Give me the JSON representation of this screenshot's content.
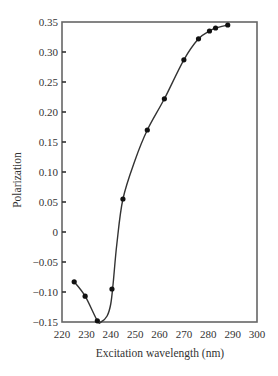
{
  "chart_data": {
    "type": "line",
    "title": "",
    "xlabel": "Excitation wavelength (nm)",
    "ylabel": "Polarization",
    "xlim": [
      220,
      300
    ],
    "ylim": [
      -0.15,
      0.35
    ],
    "xticks": [
      220,
      230,
      240,
      250,
      260,
      270,
      280,
      290,
      300
    ],
    "xtick_labels": [
      "220",
      "230",
      "240",
      "250",
      "260",
      "270",
      "280",
      "290",
      "300"
    ],
    "yticks": [
      -0.15,
      -0.1,
      -0.05,
      0,
      0.05,
      0.1,
      0.15,
      0.2,
      0.25,
      0.3,
      0.35
    ],
    "ytick_labels": [
      "−0.15",
      "−0.10",
      "−0.05",
      "0",
      "0.05",
      "0.10",
      "0.15",
      "0.20",
      "0.25",
      "0.30",
      "0.35"
    ],
    "grid": false,
    "legend": null,
    "series": [
      {
        "name": "Polarization",
        "marker": "circle",
        "line": "smooth",
        "x": [
          225,
          229.5,
          234.5,
          240.5,
          245,
          255,
          262,
          270,
          276,
          280.5,
          283,
          288
        ],
        "y": [
          -0.083,
          -0.107,
          -0.148,
          -0.095,
          0.055,
          0.17,
          0.222,
          0.287,
          0.322,
          0.335,
          0.34,
          0.345
        ]
      }
    ],
    "curve_path": [
      [
        225,
        -0.083
      ],
      [
        229.5,
        -0.107
      ],
      [
        234.5,
        -0.148
      ],
      [
        236,
        -0.15
      ],
      [
        238.5,
        -0.14
      ],
      [
        240,
        -0.12
      ],
      [
        241,
        -0.085
      ],
      [
        242.5,
        -0.02
      ],
      [
        245,
        0.055
      ],
      [
        250,
        0.12
      ],
      [
        255,
        0.17
      ],
      [
        262,
        0.222
      ],
      [
        270,
        0.287
      ],
      [
        276,
        0.322
      ],
      [
        280.5,
        0.335
      ],
      [
        283,
        0.34
      ],
      [
        288,
        0.345
      ]
    ]
  },
  "colors": {
    "axis": "#666666",
    "line": "#333333",
    "marker": "#111111",
    "text": "#333333"
  }
}
